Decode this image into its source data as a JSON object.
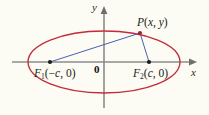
{
  "figure": {
    "background_color": "#fcfbf4",
    "axes": {
      "color": "#8c8c8c",
      "x_label": "x",
      "y_label": "y",
      "origin_label": "0",
      "x_axis_y": 62,
      "y_axis_x": 104
    },
    "ellipse": {
      "color": "#c42b3a",
      "center_x": 104,
      "center_y": 62,
      "semi_major_a": 76,
      "semi_minor_b": 31,
      "stroke_width": 1.3
    },
    "focal_radii": {
      "color": "#4a5fb0",
      "stroke_width": 1.0
    },
    "points": [
      {
        "id": "focus-1",
        "name": "F",
        "subscript": "1",
        "coords_text": "(-c, 0)",
        "label": "F1(-c, 0)",
        "x": 50,
        "y": 62,
        "dot_color": "#1b1b1b"
      },
      {
        "id": "focus-2",
        "name": "F",
        "subscript": "2",
        "coords_text": "(c, 0)",
        "label": "F2(c, 0)",
        "x": 149,
        "y": 62,
        "dot_color": "#1b1b1b"
      },
      {
        "id": "point-p",
        "name": "P",
        "subscript": "",
        "coords_text": "(x, y)",
        "label": "P(x, y)",
        "x": 140,
        "y": 33,
        "dot_color": "#b02a34"
      }
    ],
    "labels": {
      "f1_name": "F",
      "f1_sub": "1",
      "f1_open": "(−",
      "f1_var": "c",
      "f1_close": ", 0)",
      "f2_name": "F",
      "f2_sub": "2",
      "f2_open": "(",
      "f2_var": "c",
      "f2_close": ", 0)",
      "p_name": "P",
      "p_open": "(",
      "p_varx": "x",
      "p_comma": ", ",
      "p_vary": "y",
      "p_close": ")",
      "origin": "0",
      "x_axis": "x",
      "y_axis": "y"
    }
  }
}
